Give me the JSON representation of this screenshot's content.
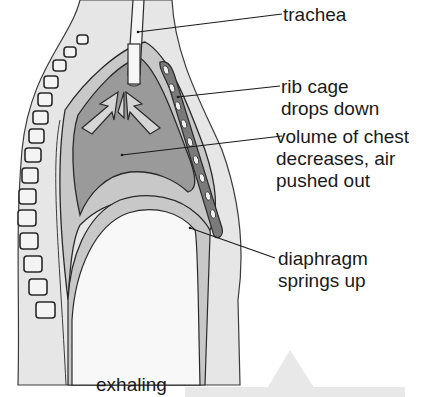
{
  "diagram": {
    "caption": "exhaling",
    "labels": {
      "trachea": {
        "lines": [
          "trachea"
        ]
      },
      "rib_cage": {
        "lines": [
          "rib cage",
          "drops down"
        ]
      },
      "volume": {
        "lines": [
          "volume of chest",
          "decreases, air",
          "pushed out"
        ]
      },
      "diaphragm": {
        "lines": [
          "diaphragm",
          "springs up"
        ]
      }
    },
    "colors": {
      "body": "#e6e6e6",
      "pleura": "#c8c8c8",
      "lung": "#9a9a9a",
      "rib": "#7a7a7a",
      "outline": "#2a2a2a",
      "abdomen": "#f8f8f8",
      "footer_bar": "#e8e8e8"
    }
  }
}
